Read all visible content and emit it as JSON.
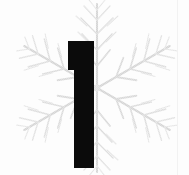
{
  "page": {
    "kind": "scanned-book-page-fragment",
    "width": 189,
    "height": 175,
    "background_color": "#fcfcfc",
    "paper_tint": "#fdfdfd"
  },
  "drop_cap": {
    "character": "1",
    "label": "decorative drop cap numeral one",
    "color": "#0b0b0b",
    "style": "solid slab, flat top serif flag, no base serif",
    "bounds": {
      "x": 68,
      "y": 41,
      "width": 26,
      "height": 127
    },
    "flag": {
      "x": 68,
      "y": 41,
      "width": 6,
      "height": 29
    },
    "stem": {
      "x": 74,
      "y": 41,
      "width": 20,
      "height": 127
    }
  },
  "ornament": {
    "name": "snowflake-star",
    "label": "faint dithered six-armed snowflake ornament behind the numeral",
    "color": "#c9c9c9",
    "color_light": "#e2e2e2",
    "center": {
      "x": 97,
      "y": 88
    },
    "arm_count": 6,
    "arm_length": 84,
    "barbs_per_arm": 5,
    "rotation_deg": 0,
    "opacity": 0.62
  },
  "artifacts": {
    "right_edge_line": {
      "label": "faint vertical scan edge line",
      "color": "#f2f2f2",
      "x": 177
    }
  },
  "accessibility": {
    "alt_text": "Large black numeral 1 set over a pale gray snowflake ornament on white paper"
  }
}
